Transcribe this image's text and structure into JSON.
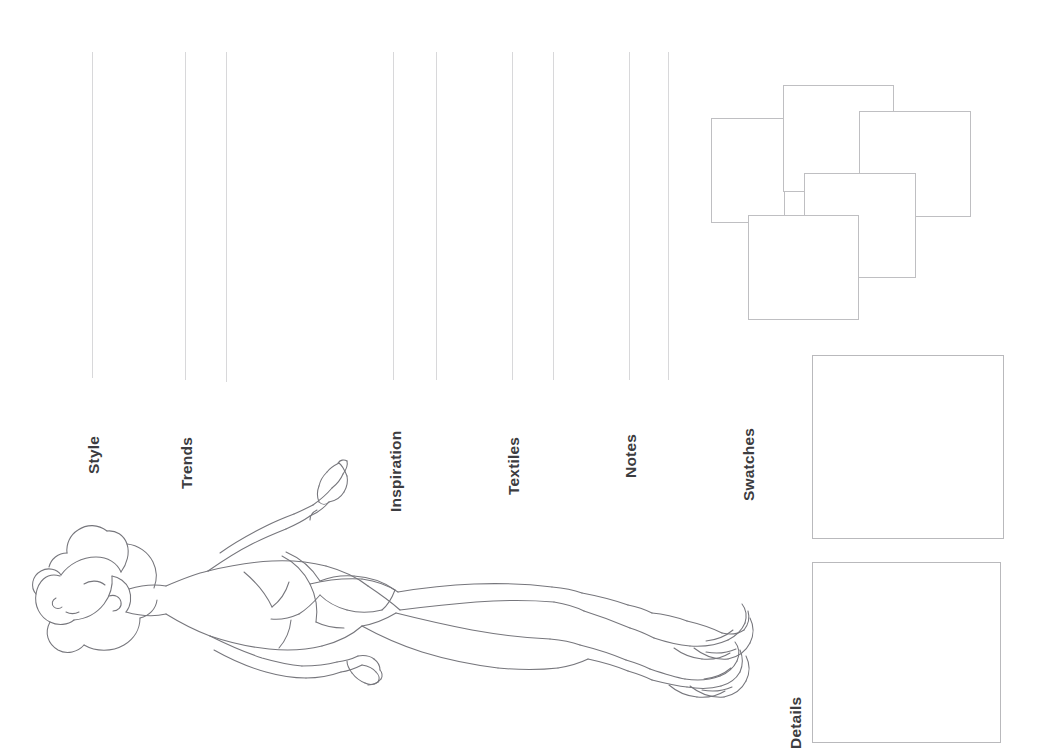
{
  "page": {
    "background_color": "#ffffff",
    "width": 1053,
    "height": 749,
    "line_color": "#d8d8da",
    "box_border_color": "#bfbfc2",
    "sketch_stroke_color": "#76767c",
    "label_color": "#3c3c40"
  },
  "sections": [
    {
      "id": "style",
      "label": "Style",
      "label_x": 85,
      "label_y": 474,
      "line_x": 92,
      "line_top": 52,
      "line_bottom": 378
    },
    {
      "id": "trends",
      "label": "Trends",
      "label_x": 178,
      "label_y": 489,
      "line_x": 185,
      "line_top": 52,
      "line_bottom": 380
    },
    {
      "id": "divider-1",
      "label": "",
      "label_x": 0,
      "label_y": 0,
      "line_x": 226,
      "line_top": 52,
      "line_bottom": 382
    },
    {
      "id": "inspiration",
      "label": "Inspiration",
      "label_x": 387,
      "label_y": 512,
      "line_x": 393,
      "line_top": 52,
      "line_bottom": 380
    },
    {
      "id": "divider-2",
      "label": "",
      "label_x": 0,
      "label_y": 0,
      "line_x": 436,
      "line_top": 52,
      "line_bottom": 380
    },
    {
      "id": "textiles",
      "label": "Textiles",
      "label_x": 505,
      "label_y": 495,
      "line_x": 512,
      "line_top": 52,
      "line_bottom": 380
    },
    {
      "id": "divider-3",
      "label": "",
      "label_x": 0,
      "label_y": 0,
      "line_x": 553,
      "line_top": 52,
      "line_bottom": 380
    },
    {
      "id": "notes",
      "label": "Notes",
      "label_x": 622,
      "label_y": 478,
      "line_x": 629,
      "line_top": 52,
      "line_bottom": 380
    },
    {
      "id": "divider-4",
      "label": "",
      "label_x": 0,
      "label_y": 0,
      "line_x": 668,
      "line_top": 52,
      "line_bottom": 380
    },
    {
      "id": "swatches",
      "label": "Swatches",
      "label_x": 740,
      "label_y": 501,
      "line_x": 0,
      "line_top": 0,
      "line_bottom": 0
    },
    {
      "id": "details",
      "label": "Details",
      "label_x": 787,
      "label_y": 749,
      "line_x": 0,
      "line_top": 0,
      "line_bottom": 0
    }
  ],
  "swatch_cluster": {
    "name": "Swatches",
    "boxes": [
      {
        "id": "swatch-1",
        "x": 711,
        "y": 118,
        "w": 74,
        "h": 105,
        "z": 1
      },
      {
        "id": "swatch-2",
        "x": 783,
        "y": 85,
        "w": 111,
        "h": 107,
        "z": 2
      },
      {
        "id": "swatch-3",
        "x": 859,
        "y": 111,
        "w": 112,
        "h": 106,
        "z": 3
      },
      {
        "id": "swatch-4",
        "x": 804,
        "y": 173,
        "w": 112,
        "h": 105,
        "z": 4
      },
      {
        "id": "swatch-5",
        "x": 748,
        "y": 215,
        "w": 111,
        "h": 105,
        "z": 5
      }
    ]
  },
  "panels": [
    {
      "id": "panel-upper",
      "name": "swatches-panel",
      "x": 812,
      "y": 355,
      "w": 192,
      "h": 184
    },
    {
      "id": "panel-lower",
      "name": "details-panel",
      "x": 812,
      "y": 562,
      "w": 189,
      "h": 181
    }
  ],
  "figure": {
    "name": "fashion-croquis"
  }
}
